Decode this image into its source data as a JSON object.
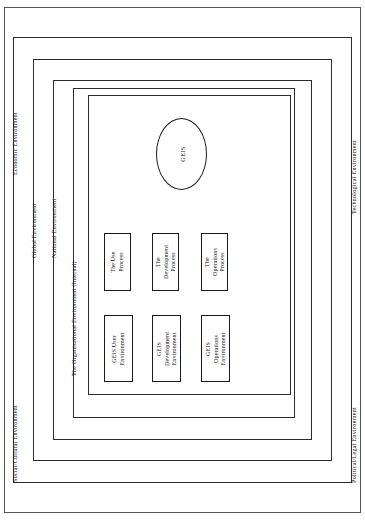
{
  "diagram": {
    "stroke_color": "#1a1a1a",
    "background_color": "#ffffff",
    "frames": {
      "outer": {
        "label": ""
      },
      "global": {
        "label": "Global  Environment"
      },
      "national": {
        "label": "National  Environment"
      },
      "organisational": {
        "label": "The Organisational Environment (Internal)"
      },
      "inner": {
        "label": ""
      }
    },
    "edge_labels": {
      "social_cultural": "Social/Cultural  Environment",
      "economic": "Economic  Environment",
      "technological": "Technological  Environment",
      "political_legal": "Political/Legal  Environment"
    },
    "core": {
      "ellipse_label": "GEIS"
    },
    "process_boxes": [
      {
        "id": "use-process",
        "line1": "The  Use",
        "line2": "Process"
      },
      {
        "id": "development-process",
        "line1": "The",
        "line2": "Development",
        "line3": "Process"
      },
      {
        "id": "operations-process",
        "line1": "The",
        "line2": "Operations",
        "line3": "Process"
      }
    ],
    "environment_boxes": [
      {
        "id": "user-env",
        "line1": "GEIS User",
        "line2": "Environment"
      },
      {
        "id": "development-env",
        "line1": "GEIS",
        "line2": "Development",
        "line3": "Environment"
      },
      {
        "id": "operations-env",
        "line1": "GEIS",
        "line2": "Operations",
        "line3": "Environment"
      }
    ]
  }
}
